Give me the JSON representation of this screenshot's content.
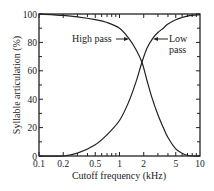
{
  "chart_data": {
    "type": "line",
    "title": "",
    "xlabel": "Cutoff frequency (kHz)",
    "ylabel": "Syllable articulation (%)",
    "xscale": "log",
    "xlim": [
      0.1,
      10
    ],
    "ylim": [
      0,
      100
    ],
    "xticks": [
      0.1,
      0.2,
      0.5,
      1,
      2,
      5,
      10
    ],
    "xtick_labels": [
      "0.1",
      "0.2",
      "0.5",
      "1",
      "2",
      "5",
      "10"
    ],
    "yticks": [
      0,
      20,
      40,
      60,
      80,
      100
    ],
    "ytick_labels": [
      "0",
      "20",
      "40",
      "60",
      "80",
      "100"
    ],
    "grid": false,
    "series": [
      {
        "name": "High pass",
        "x": [
          0.1,
          0.2,
          0.3,
          0.5,
          0.7,
          1.0,
          1.3,
          1.6,
          1.9,
          2.2,
          2.5,
          3.0,
          3.5,
          4.0,
          5.0,
          6.0,
          7.0,
          8.0,
          10.0
        ],
        "y": [
          100,
          99,
          98,
          96,
          94,
          90,
          83,
          75,
          66,
          53,
          42,
          29,
          20,
          13,
          5,
          2,
          0.5,
          0,
          0
        ]
      },
      {
        "name": "Low pass",
        "x": [
          0.1,
          0.2,
          0.3,
          0.5,
          0.7,
          1.0,
          1.3,
          1.6,
          1.9,
          2.2,
          2.6,
          3.0,
          3.5,
          4.0,
          5.0,
          6.0,
          7.0,
          8.0,
          10.0
        ],
        "y": [
          0,
          0,
          2,
          8,
          15,
          25,
          38,
          52,
          66,
          76,
          83,
          87,
          90,
          93,
          96,
          97.5,
          98.5,
          99,
          99.5
        ]
      }
    ],
    "annotations": [
      {
        "text": "High pass",
        "points_to": "High pass",
        "at": [
          1.3,
          83
        ]
      },
      {
        "text": "Low pass",
        "points_to": "Low pass",
        "at": [
          2.6,
          83
        ]
      }
    ],
    "crossover": {
      "x": 1.9,
      "y": 66
    }
  }
}
